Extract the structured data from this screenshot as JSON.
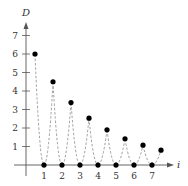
{
  "chart_data": {
    "type": "scatter",
    "title": "",
    "xlabel": "i",
    "ylabel": "D",
    "xlim": [
      0,
      8
    ],
    "ylim": [
      0,
      7.5
    ],
    "x_ticks": [
      1,
      2,
      3,
      4,
      5,
      6,
      7
    ],
    "y_ticks": [
      1,
      2,
      3,
      4,
      5,
      6,
      7
    ],
    "grid": false,
    "series": [
      {
        "name": "peak heights",
        "marker": "filled-circle",
        "x": [
          0.5,
          1.5,
          2.5,
          3.5,
          4.5,
          5.5,
          6.5,
          7.5
        ],
        "y": [
          6,
          4.5,
          3.375,
          2.53,
          1.9,
          1.42,
          1.07,
          0.8
        ]
      },
      {
        "name": "bounce points",
        "marker": "filled-circle",
        "x": [
          1,
          2,
          3,
          4,
          5,
          6,
          7
        ],
        "y": [
          0,
          0,
          0,
          0,
          0,
          0,
          0
        ]
      }
    ],
    "annotations": "Dashed parabolic arcs connect each bounce point to successive peaks (bouncing-ball path)",
    "colors": {
      "axis": "#555555",
      "points": "#000000",
      "dashes": "#888888"
    }
  }
}
